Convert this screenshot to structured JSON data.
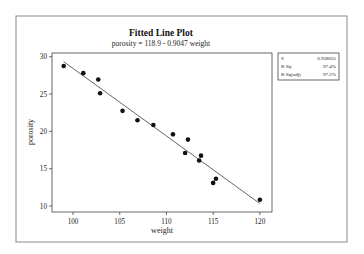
{
  "chart_data": {
    "type": "scatter",
    "title": "Fitted Line Plot",
    "subtitle": "porosity =  118.9 - 0.9047 weight",
    "xlabel": "weight",
    "ylabel": "porosity",
    "xlim": [
      97.75,
      121.3
    ],
    "ylim": [
      9.2,
      30.5
    ],
    "xticks": [
      100,
      105,
      110,
      115,
      120
    ],
    "yticks": [
      10,
      15,
      20,
      25,
      30
    ],
    "grid": false,
    "legend": "none",
    "fit_line": {
      "intercept": 118.9,
      "slope": -0.9047,
      "x_range": [
        99.0,
        120.0
      ]
    },
    "series": [
      {
        "name": "observations",
        "x": [
          99.0,
          101.1,
          102.7,
          102.9,
          105.3,
          106.9,
          108.6,
          110.7,
          112.3,
          112.0,
          113.5,
          113.7,
          115.0,
          115.3,
          120.0
        ],
        "y": [
          28.75,
          27.8,
          26.95,
          25.1,
          22.75,
          21.5,
          20.85,
          19.6,
          18.9,
          17.1,
          16.1,
          16.75,
          13.1,
          13.65,
          10.85
        ]
      }
    ],
    "stats_box": {
      "position": "top-right",
      "rows": [
        {
          "label": "S",
          "value": "0.938035"
        },
        {
          "label": "R-Sq",
          "value": "97.4%"
        },
        {
          "label": "R-Sq(adj)",
          "value": "97.2%"
        }
      ]
    }
  }
}
